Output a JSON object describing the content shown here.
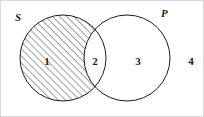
{
  "figure": {
    "type": "venn-diagram",
    "width": 204,
    "height": 117,
    "background_color": "#ffffff",
    "stroke_color": "#1c1c1c",
    "hatch_color": "#2a2a2a"
  },
  "sets": {
    "left": {
      "label": "S",
      "center_x": 62,
      "center_y": 57,
      "radius": 43,
      "fill": "diagonal-hatch",
      "hatch_angle_deg": 45,
      "hatch_spacing_px": 5
    },
    "right": {
      "label": "P",
      "center_x": 126,
      "center_y": 57,
      "radius": 43,
      "fill": "none"
    }
  },
  "regions": [
    {
      "id": "1",
      "label": "1",
      "description": "S only (shaded)",
      "shaded": true
    },
    {
      "id": "2",
      "label": "2",
      "description": "S intersect P (unshaded)",
      "shaded": false
    },
    {
      "id": "3",
      "label": "3",
      "description": "P only (unshaded)",
      "shaded": false
    },
    {
      "id": "4",
      "label": "4",
      "description": "outside both sets (unshaded)",
      "shaded": false
    }
  ]
}
